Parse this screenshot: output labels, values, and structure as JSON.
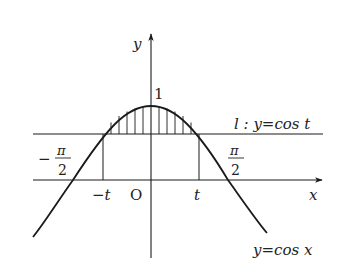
{
  "diagram": {
    "type": "function-graph",
    "colors": {
      "stroke": "#1a1a1a",
      "background": "#ffffff",
      "text": "#222222"
    },
    "axes": {
      "x_label": "x",
      "y_label": "y",
      "origin_label": "O"
    },
    "labels": {
      "peak": "1",
      "neg_t": "−t",
      "pos_t": "t",
      "neg_pi_sign": "−",
      "pi": "π",
      "two": "2",
      "line_l": "l : y=cos t",
      "curve": "y=cos x"
    },
    "features": {
      "curve": "y = cos x",
      "line": "l : y = cos t",
      "hatched_region": "between y = cos x and y = cos t for −t ≤ x ≤ t",
      "vertical_drops": [
        "x = −t",
        "x = t"
      ],
      "zero_crossings": [
        "−π/2",
        "π/2"
      ]
    }
  }
}
